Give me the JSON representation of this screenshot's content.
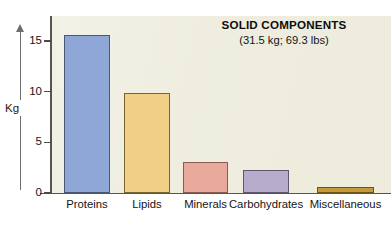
{
  "chart_data": {
    "type": "bar",
    "title": "SOLID COMPONENTS",
    "subtitle": "(31.5 kg; 69.3 lbs)",
    "xlabel": "",
    "ylabel": "Kg",
    "ylim": [
      0,
      17.5
    ],
    "yticks": [
      0,
      5,
      10,
      15
    ],
    "ytick_labels": [
      "0",
      "5",
      "10",
      "15"
    ],
    "grid": false,
    "legend": "none",
    "categories": [
      "Proteins",
      "Lipids",
      "Minerals",
      "Carbohydrates",
      "Miscellaneous"
    ],
    "values": [
      15.6,
      9.9,
      3.1,
      2.3,
      0.6
    ],
    "bar_colors": [
      "#8ea7d6",
      "#f0cf87",
      "#e8a99a",
      "#b6accb",
      "#c49a3c"
    ],
    "bar_border_colors": [
      "#4a5a70",
      "#7a6430",
      "#8a5b50",
      "#5d566e",
      "#6e5418"
    ],
    "plot_background": "#edecdd",
    "axis_color": "#555552",
    "text_color": "#141414"
  },
  "axis": {
    "y_label_text": "Kg"
  }
}
